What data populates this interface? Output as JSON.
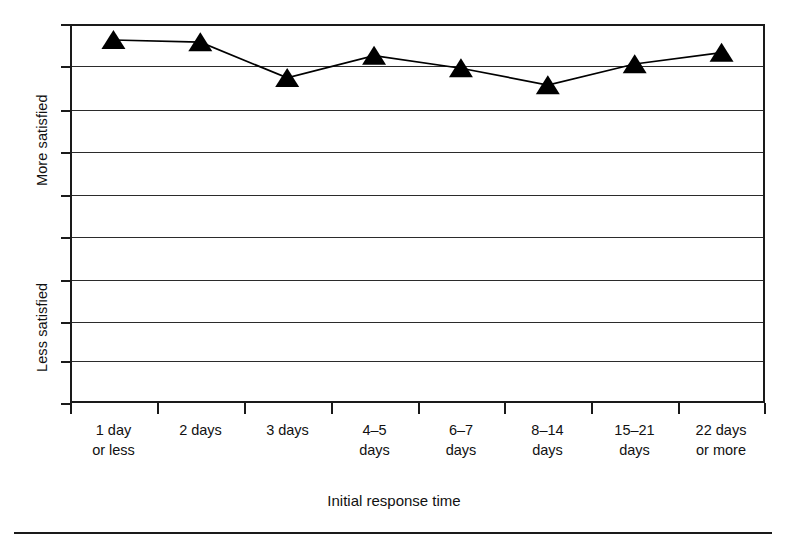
{
  "chart_data": {
    "type": "line",
    "title": "",
    "subtitle": "",
    "xlabel": "Initial response time",
    "ylabel": "",
    "categories": [
      "1 day or less",
      "2 days",
      "3 days",
      "4–5 days",
      "6–7 days",
      "8–14 days",
      "15–21 days",
      "22 days or more"
    ],
    "values": [
      8.62,
      8.57,
      7.72,
      8.25,
      7.95,
      7.55,
      8.05,
      8.32
    ],
    "ylim": [
      0,
      9
    ],
    "yticks": [
      0,
      1,
      2,
      3,
      4,
      5,
      6,
      7,
      8,
      9
    ],
    "ytick_labels": [
      "",
      "",
      "",
      "",
      "",
      "",
      "",
      "",
      "",
      ""
    ],
    "y_axis_anchors": [
      {
        "label": "More satisfied",
        "position": "upper"
      },
      {
        "label": "Less satisfied",
        "position": "lower"
      }
    ],
    "grid": true,
    "grid_axis": "y",
    "legend": "none",
    "marker": "triangle",
    "marker_color": "#000000",
    "line_color": "#000000",
    "series": [
      {
        "name": "Satisfaction",
        "values": [
          8.62,
          8.57,
          7.72,
          8.25,
          7.95,
          7.55,
          8.05,
          8.32
        ]
      }
    ]
  },
  "axes": {
    "x_title": "Initial response time",
    "x_tick_labels": [
      {
        "line1": "1 day",
        "line2": "or less"
      },
      {
        "line1": "2 days",
        "line2": ""
      },
      {
        "line1": "3 days",
        "line2": ""
      },
      {
        "line1": "4–5",
        "line2": "days"
      },
      {
        "line1": "6–7",
        "line2": "days"
      },
      {
        "line1": "8–14",
        "line2": "days"
      },
      {
        "line1": "15–21",
        "line2": "days"
      },
      {
        "line1": "22 days",
        "line2": "or more"
      }
    ],
    "y_caption_more": "More satisfied",
    "y_caption_less": "Less satisfied"
  },
  "style": {
    "axis_color": "#1a1a1a",
    "grid_color": "#2b2b2b",
    "series_color": "#000000",
    "background": "#ffffff"
  }
}
